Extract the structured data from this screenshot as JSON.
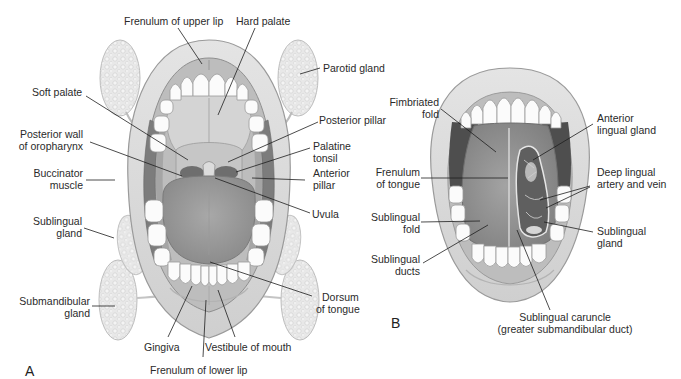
{
  "figure": {
    "panels": [
      {
        "letter": "A",
        "title": "Open mouth, tongue down"
      },
      {
        "letter": "B",
        "title": "Open mouth, tongue raised"
      }
    ],
    "panel_a": {
      "letter": "A",
      "labels": {
        "frenulum_upper_lip": "Frenulum of upper lip",
        "hard_palate": "Hard palate",
        "parotid_gland": "Parotid gland",
        "soft_palate": "Soft palate",
        "posterior_pillar": "Posterior pillar",
        "posterior_wall_1": "Posterior wall",
        "posterior_wall_2": "of oropharynx",
        "palatine_tonsil_1": "Palatine",
        "palatine_tonsil_2": "tonsil",
        "buccinator_1": "Buccinator",
        "buccinator_2": "muscle",
        "anterior_pillar_1": "Anterior",
        "anterior_pillar_2": "pillar",
        "uvula": "Uvula",
        "sublingual_gland_1": "Sublingual",
        "sublingual_gland_2": "gland",
        "submandibular_1": "Submandibular",
        "submandibular_2": "gland",
        "dorsum_1": "Dorsum",
        "dorsum_2": "of tongue",
        "gingiva": "Gingiva",
        "vestibule": "Vestibule of mouth",
        "frenulum_lower_lip": "Frenulum of lower lip"
      }
    },
    "panel_b": {
      "letter": "B",
      "labels": {
        "fimbriated_1": "Fimbriated",
        "fimbriated_2": "fold",
        "anterior_lingual_1": "Anterior",
        "anterior_lingual_2": "lingual gland",
        "frenulum_tongue_1": "Frenulum",
        "frenulum_tongue_2": "of tongue",
        "deep_lingual_1": "Deep lingual",
        "deep_lingual_2": "artery and vein",
        "sublingual_fold_1": "Sublingual",
        "sublingual_fold_2": "fold",
        "sublingual_gland_1": "Sublingual",
        "sublingual_gland_2": "gland",
        "sublingual_ducts_1": "Sublingual",
        "sublingual_ducts_2": "ducts",
        "caruncle_1": "Sublingual caruncle",
        "caruncle_2": "(greater submandibular duct)"
      }
    },
    "colors": {
      "background": "#ffffff",
      "lip": "#d9d9d9",
      "lip_edge": "#9a9a9a",
      "gland": "#e6e6e6",
      "teeth": "#fbfbfb",
      "tongue": "#9c9c9c",
      "palate": "#d0d0d0",
      "throat_dark": "#5a5a5a",
      "muscle": "#7a7a7a",
      "leader_line": "#1e1e1e"
    }
  }
}
